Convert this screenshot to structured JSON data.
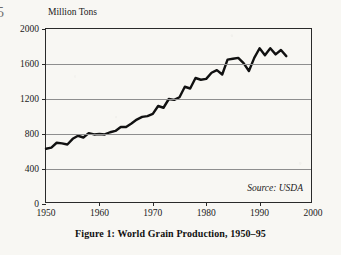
{
  "folio": "5",
  "caption": "Figure 1: World Grain Production, 1950–95",
  "source_note": "Source: USDA",
  "axis_title": "Million Tons",
  "colors": {
    "background": "#f8f7f3",
    "line": "#111111",
    "frame": "#2a2a2a",
    "gridline": "#8e8e8e",
    "text": "#1a1a1a"
  },
  "chart_data": {
    "type": "line",
    "title": "Figure 1: World Grain Production, 1950–95",
    "xlabel": "",
    "ylabel": "Million Tons",
    "xlim": [
      1950,
      2000
    ],
    "ylim": [
      0,
      2000
    ],
    "xticks": [
      1950,
      1960,
      1970,
      1980,
      1990,
      2000
    ],
    "yticks": [
      0,
      400,
      800,
      1200,
      1600,
      2000
    ],
    "xtick_labels": [
      "1950",
      "1960",
      "1970",
      "1980",
      "1990",
      "2000"
    ],
    "ytick_labels": [
      "0",
      "400",
      "800",
      "1200",
      "1600",
      "2000"
    ],
    "grid": "horizontal",
    "legend": "none",
    "annotations": [
      "Source: USDA"
    ],
    "series": [
      {
        "name": "World Grain Production",
        "units": "Million Tons",
        "x": [
          1950,
          1951,
          1952,
          1953,
          1954,
          1955,
          1956,
          1957,
          1958,
          1959,
          1960,
          1961,
          1962,
          1963,
          1964,
          1965,
          1966,
          1967,
          1968,
          1969,
          1970,
          1971,
          1972,
          1973,
          1974,
          1975,
          1976,
          1977,
          1978,
          1979,
          1980,
          1981,
          1982,
          1983,
          1984,
          1985,
          1986,
          1987,
          1988,
          1989,
          1990,
          1991,
          1992,
          1993,
          1994,
          1995
        ],
        "values": [
          631,
          645,
          700,
          693,
          680,
          745,
          780,
          760,
          810,
          795,
          800,
          795,
          820,
          835,
          880,
          880,
          920,
          965,
          995,
          1005,
          1030,
          1120,
          1100,
          1200,
          1190,
          1220,
          1340,
          1320,
          1440,
          1420,
          1430,
          1500,
          1530,
          1480,
          1650,
          1660,
          1670,
          1610,
          1520,
          1670,
          1780,
          1700,
          1780,
          1710,
          1760,
          1690
        ]
      }
    ]
  }
}
